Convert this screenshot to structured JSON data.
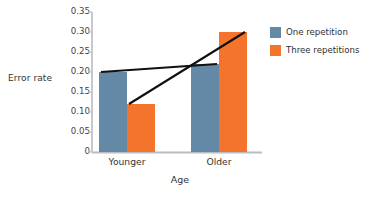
{
  "chart_data": {
    "type": "bar",
    "title": "",
    "xlabel": "Age",
    "ylabel": "Error rate",
    "categories": [
      "Younger",
      "Older"
    ],
    "series": [
      {
        "name": "One repetition",
        "values": [
          0.2,
          0.22
        ],
        "color": "#6389a6"
      },
      {
        "name": "Three repetitions",
        "values": [
          0.12,
          0.3
        ],
        "color": "#f4742c"
      }
    ],
    "ylim": [
      0,
      0.35
    ],
    "yticks": [
      0,
      0.05,
      0.1,
      0.15,
      0.2,
      0.25,
      0.3,
      0.35
    ],
    "ytick_labels": [
      "0",
      "0.05",
      "0.10",
      "0.15",
      "0.20",
      "0.25",
      "0.30",
      "0.35"
    ],
    "grid": false,
    "legend_position": "right",
    "annotations": [
      {
        "name": "one-repetition-trend-line",
        "from": [
          0,
          0.2
        ],
        "to": [
          1,
          0.22
        ],
        "color": "#111111"
      },
      {
        "name": "three-repetitions-trend-line",
        "from": [
          0,
          0.12
        ],
        "to": [
          1,
          0.3
        ],
        "color": "#111111"
      }
    ]
  },
  "legend": {
    "items": [
      {
        "label": "One repetition",
        "color": "#6389a6"
      },
      {
        "label": "Three repetitions",
        "color": "#f4742c"
      }
    ]
  },
  "axes": {
    "y_title": "Error rate",
    "x_title": "Age"
  }
}
